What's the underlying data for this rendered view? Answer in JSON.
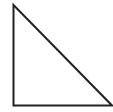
{
  "diagram": {
    "shape": "right-triangle",
    "background": "#ffffff",
    "stroke": "#222222",
    "stroke_width": 2,
    "vertices": {
      "top": [
        13.5,
        5
      ],
      "bottom_left": [
        13.5,
        105.5
      ],
      "bottom_right": [
        112,
        105.5
      ]
    }
  }
}
